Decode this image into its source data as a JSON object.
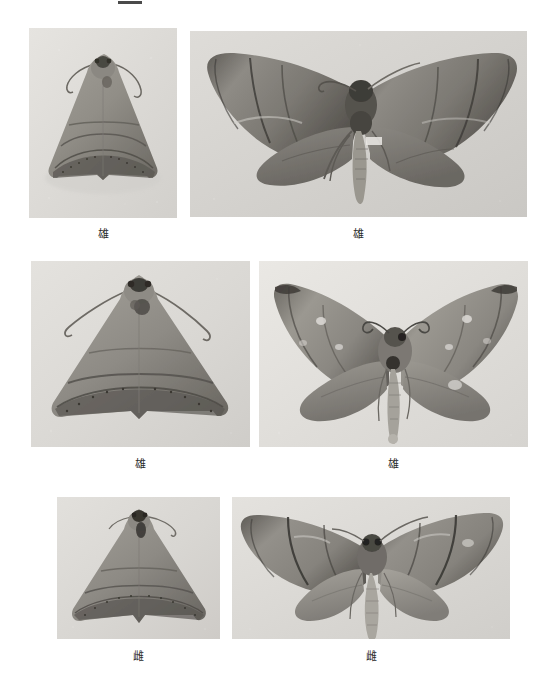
{
  "plate": {
    "background_color": "#ffffff",
    "width": 556,
    "height": 685,
    "top_rule": {
      "present": true,
      "color": "#4a4a4a",
      "x": 118,
      "y": 1,
      "width": 24,
      "height": 3
    }
  },
  "figures": [
    {
      "id": "fig-1",
      "position": "row1-left",
      "caption": "雄",
      "view": "resting-folded-wings",
      "orientation": "dorsal",
      "frame": {
        "x": 29,
        "y": 28,
        "width": 148,
        "height": 190
      },
      "caption_box": {
        "x": 29,
        "y": 228,
        "width": 148
      },
      "photo_bg": "#dedcd8",
      "moth_tone": "#8d8a84"
    },
    {
      "id": "fig-2",
      "position": "row1-right",
      "caption": "雄",
      "view": "spread-wings",
      "orientation": "dorsal",
      "frame": {
        "x": 190,
        "y": 31,
        "width": 337,
        "height": 186
      },
      "caption_box": {
        "x": 190,
        "y": 228,
        "width": 337
      },
      "photo_bg": "#d5d3cf",
      "moth_tone": "#7e7b75"
    },
    {
      "id": "fig-3",
      "position": "row2-left",
      "caption": "雄",
      "view": "resting-folded-wings",
      "orientation": "dorsal",
      "frame": {
        "x": 31,
        "y": 261,
        "width": 219,
        "height": 186
      },
      "caption_box": {
        "x": 31,
        "y": 458,
        "width": 219
      },
      "photo_bg": "#dddbd7",
      "moth_tone": "#8b8882"
    },
    {
      "id": "fig-4",
      "position": "row2-right",
      "caption": "雄",
      "view": "spread-wings",
      "orientation": "dorsal",
      "frame": {
        "x": 259,
        "y": 261,
        "width": 269,
        "height": 186
      },
      "caption_box": {
        "x": 259,
        "y": 458,
        "width": 269
      },
      "photo_bg": "#e2e0dc",
      "moth_tone": "#908d87"
    },
    {
      "id": "fig-5",
      "position": "row3-left",
      "caption": "雌",
      "view": "resting-folded-wings",
      "orientation": "dorsal",
      "frame": {
        "x": 57,
        "y": 497,
        "width": 163,
        "height": 142
      },
      "caption_box": {
        "x": 57,
        "y": 650,
        "width": 163
      },
      "photo_bg": "#dbd9d5",
      "moth_tone": "#8a8781"
    },
    {
      "id": "fig-6",
      "position": "row3-right",
      "caption": "雌",
      "view": "spread-wings",
      "orientation": "dorsal",
      "frame": {
        "x": 232,
        "y": 497,
        "width": 278,
        "height": 142
      },
      "caption_box": {
        "x": 232,
        "y": 650,
        "width": 278
      },
      "photo_bg": "#dcdad6",
      "moth_tone": "#878480"
    }
  ]
}
